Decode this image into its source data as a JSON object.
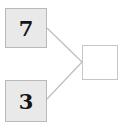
{
  "diagram": {
    "background_color": "#ffffff",
    "nodes": [
      {
        "id": "node-top",
        "label": "7",
        "fill_color": "#e9e9e9",
        "border_color": "#b9b9b9"
      },
      {
        "id": "node-bottom",
        "label": "3",
        "fill_color": "#e9e9e9",
        "border_color": "#b9b9b9"
      },
      {
        "id": "node-out",
        "label": "",
        "fill_color": "#ffffff",
        "border_color": "#c6c6c6"
      }
    ],
    "edges": [
      {
        "from": "node-top",
        "to": "node-out",
        "color": "#bdbdbd",
        "x1": 47,
        "y1": 28,
        "x2": 82,
        "y2": 62
      },
      {
        "from": "node-bottom",
        "to": "node-out",
        "color": "#bdbdbd",
        "x1": 47,
        "y1": 99,
        "x2": 82,
        "y2": 62
      }
    ]
  }
}
